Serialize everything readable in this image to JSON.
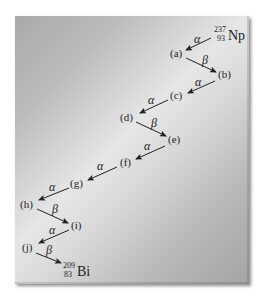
{
  "diagram": {
    "start": {
      "mass": "237",
      "atomic": "93",
      "symbol": "Np"
    },
    "end": {
      "mass": "209",
      "atomic": "83",
      "symbol": "Bi"
    },
    "nodes": [
      "(a)",
      "(b)",
      "(c)",
      "(d)",
      "(e)",
      "(f)",
      "(g)",
      "(h)",
      "(i)",
      "(j)"
    ],
    "steps": [
      {
        "from": "Np",
        "to": "(a)",
        "decay": "α"
      },
      {
        "from": "(a)",
        "to": "(b)",
        "decay": "β"
      },
      {
        "from": "(b)",
        "to": "(c)",
        "decay": "α"
      },
      {
        "from": "(c)",
        "to": "(d)",
        "decay": "α"
      },
      {
        "from": "(d)",
        "to": "(e)",
        "decay": "β"
      },
      {
        "from": "(e)",
        "to": "(f)",
        "decay": "α"
      },
      {
        "from": "(f)",
        "to": "(g)",
        "decay": "α"
      },
      {
        "from": "(g)",
        "to": "(h)",
        "decay": "α"
      },
      {
        "from": "(h)",
        "to": "(i)",
        "decay": "β"
      },
      {
        "from": "(i)",
        "to": "(j)",
        "decay": "α"
      },
      {
        "from": "(j)",
        "to": "Bi",
        "decay": "β"
      }
    ],
    "colors": {
      "panel_light": "#e6e6e6",
      "panel_dark": "#a5a5a5",
      "ink": "#222222"
    }
  }
}
